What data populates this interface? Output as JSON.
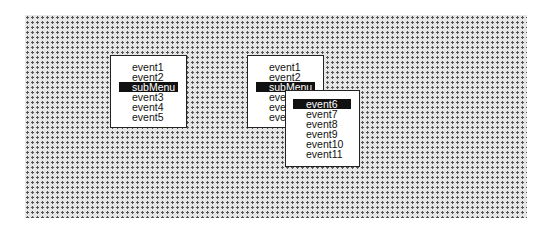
{
  "desktop": {
    "pattern": "dotted-gray"
  },
  "menu1": {
    "items": [
      {
        "label": "event1",
        "highlighted": false
      },
      {
        "label": "event2",
        "highlighted": false
      },
      {
        "label": "subMenu",
        "highlighted": true
      },
      {
        "label": "event3",
        "highlighted": false
      },
      {
        "label": "event4",
        "highlighted": false
      },
      {
        "label": "event5",
        "highlighted": false
      }
    ]
  },
  "menu2": {
    "items": [
      {
        "label": "event1",
        "highlighted": false
      },
      {
        "label": "event2",
        "highlighted": false
      },
      {
        "label": "subMenu",
        "highlighted": true
      },
      {
        "label": "event3",
        "highlighted": false
      },
      {
        "label": "event4",
        "highlighted": false
      },
      {
        "label": "event5",
        "highlighted": false
      }
    ]
  },
  "submenu": {
    "items": [
      {
        "label": "event6",
        "highlighted": true
      },
      {
        "label": "event7",
        "highlighted": false
      },
      {
        "label": "event8",
        "highlighted": false
      },
      {
        "label": "event9",
        "highlighted": false
      },
      {
        "label": "event10",
        "highlighted": false
      },
      {
        "label": "event11",
        "highlighted": false
      }
    ]
  },
  "colors": {
    "highlight_bg": "#111111",
    "highlight_fg": "#ffffff",
    "menu_bg": "#ffffff"
  }
}
